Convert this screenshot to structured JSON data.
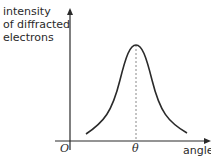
{
  "diagram": {
    "ylabel_lines": [
      "intensity",
      "of diffracted",
      "electrons"
    ],
    "xlabel": "angle",
    "origin_label": "O",
    "peak_label": "θ",
    "curve": "bell-shaped intensity peak centred at θ",
    "colors": {
      "line": "#2a2a2a",
      "dashed": "#888888"
    }
  }
}
